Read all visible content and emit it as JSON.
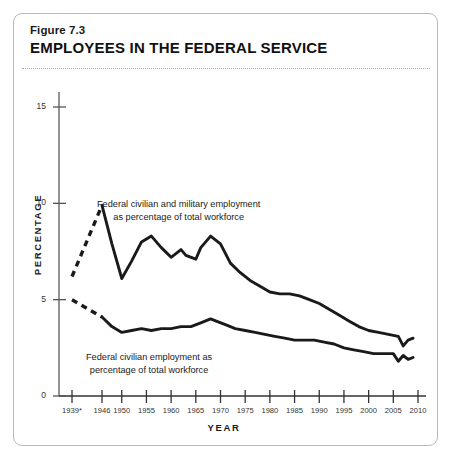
{
  "figure": {
    "number": "Figure 7.3",
    "title": "EMPLOYEES IN THE FEDERAL SERVICE"
  },
  "chart_data": {
    "type": "line",
    "title": "EMPLOYEES IN THE FEDERAL SERVICE",
    "xlabel": "YEAR",
    "ylabel": "PERCENTAGE",
    "xlim": [
      1939,
      2010
    ],
    "ylim": [
      0,
      15
    ],
    "yticks": [
      0,
      5,
      10,
      15
    ],
    "xticks": [
      "1939*",
      "1946",
      "1950",
      "1955",
      "1960",
      "1965",
      "1970",
      "1975",
      "1980",
      "1985",
      "1990",
      "1995",
      "2000",
      "2005",
      "2010"
    ],
    "xtick_values": [
      1939,
      1946,
      1950,
      1955,
      1960,
      1965,
      1970,
      1975,
      1980,
      1985,
      1990,
      1995,
      2000,
      2005,
      2010
    ],
    "grid": false,
    "legend_position": "inline-annotation",
    "footnote_marker": "*",
    "series": [
      {
        "name": "Federal civilian and military employment as percentage of total workforce",
        "annotation": "Federal civilian and military employment\nas percentage of total workforce",
        "dashed_until": 1946,
        "x": [
          1939,
          1946,
          1948,
          1950,
          1952,
          1954,
          1956,
          1958,
          1960,
          1962,
          1963,
          1965,
          1966,
          1968,
          1970,
          1972,
          1974,
          1976,
          1978,
          1980,
          1982,
          1984,
          1986,
          1988,
          1990,
          1992,
          1994,
          1996,
          1998,
          2000,
          2002,
          2004,
          2006,
          2007,
          2008,
          2009
        ],
        "values": [
          6.2,
          9.9,
          7.9,
          6.1,
          7.0,
          8.0,
          8.3,
          7.7,
          7.2,
          7.6,
          7.3,
          7.1,
          7.7,
          8.3,
          7.9,
          6.9,
          6.4,
          6.0,
          5.7,
          5.4,
          5.3,
          5.3,
          5.2,
          5.0,
          4.8,
          4.5,
          4.2,
          3.9,
          3.6,
          3.4,
          3.3,
          3.2,
          3.1,
          2.6,
          2.9,
          3.0
        ]
      },
      {
        "name": "Federal civilian employment as percentage of total workforce",
        "annotation": "Federal civilian employment as\npercentage of total workforce",
        "dashed_until": 1946,
        "x": [
          1939,
          1946,
          1948,
          1950,
          1952,
          1954,
          1956,
          1958,
          1960,
          1962,
          1964,
          1966,
          1968,
          1969,
          1971,
          1973,
          1975,
          1977,
          1979,
          1981,
          1983,
          1985,
          1987,
          1989,
          1991,
          1993,
          1995,
          1997,
          1999,
          2001,
          2003,
          2005,
          2006,
          2007,
          2008,
          2009
        ],
        "values": [
          5.0,
          4.1,
          3.6,
          3.3,
          3.4,
          3.5,
          3.4,
          3.5,
          3.5,
          3.6,
          3.6,
          3.8,
          4.0,
          3.9,
          3.7,
          3.5,
          3.4,
          3.3,
          3.2,
          3.1,
          3.0,
          2.9,
          2.9,
          2.9,
          2.8,
          2.7,
          2.5,
          2.4,
          2.3,
          2.2,
          2.2,
          2.2,
          1.8,
          2.1,
          1.9,
          2.0
        ]
      }
    ]
  },
  "colors": {
    "line": "#1a1a1a",
    "axis": "#555555",
    "border": "#b9b9b9",
    "text": "#1a1a1a",
    "background": "#ffffff"
  }
}
